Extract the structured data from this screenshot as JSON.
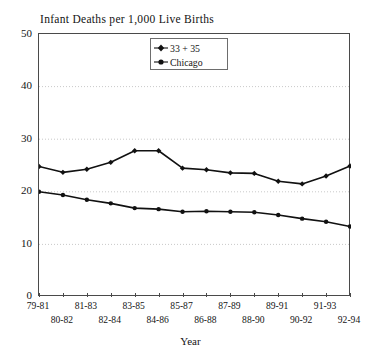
{
  "chart_data": {
    "type": "line",
    "title": "Infant Deaths per 1,000 Live Births",
    "xlabel": "Year",
    "ylabel": "",
    "ylim": [
      0,
      50
    ],
    "y_ticks": [
      0,
      10,
      20,
      30,
      40,
      50
    ],
    "grid": "horizontal-dotted",
    "legend_position": "top-center-inside",
    "categories": [
      "79-81",
      "80-82",
      "81-83",
      "82-84",
      "83-85",
      "84-86",
      "85-87",
      "86-88",
      "87-89",
      "88-90",
      "89-91",
      "90-92",
      "91-93",
      "92-94"
    ],
    "series": [
      {
        "name": "33 + 35",
        "marker": "diamond",
        "color": "#111111",
        "values": [
          24.8,
          23.7,
          24.3,
          25.6,
          27.8,
          27.8,
          24.5,
          24.2,
          23.6,
          23.5,
          22.0,
          21.5,
          23.0,
          24.9
        ]
      },
      {
        "name": "Chicago",
        "marker": "circle",
        "color": "#111111",
        "values": [
          20.0,
          19.4,
          18.5,
          17.8,
          16.9,
          16.7,
          16.2,
          16.3,
          16.2,
          16.1,
          15.6,
          14.9,
          14.3,
          13.4
        ]
      }
    ]
  },
  "legend": {
    "entries": [
      {
        "label": "33 + 35"
      },
      {
        "label": "Chicago"
      }
    ]
  },
  "axes": {
    "y_labels": [
      "50",
      "40",
      "30",
      "20",
      "10",
      "0"
    ],
    "x_labels_top": [
      "79-81",
      "81-83",
      "83-85",
      "85-87",
      "87-89",
      "89-91",
      "91-93"
    ],
    "x_labels_bottom": [
      "80-82",
      "82-84",
      "84-86",
      "86-88",
      "88-90",
      "90-92",
      "92-94"
    ],
    "x_title": "Year"
  },
  "colors": {
    "line": "#111111",
    "frame": "#4a4a4a",
    "grid": "#c9c9c9",
    "text": "#141414",
    "background": "#ffffff"
  }
}
